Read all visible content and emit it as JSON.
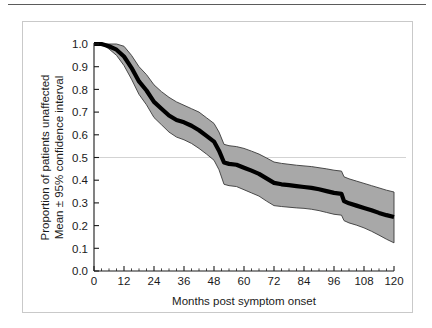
{
  "figure": {
    "top_rule": "horizontal-rule",
    "border_color": "#c9c9c9",
    "background": "#ffffff"
  },
  "chart_data": {
    "type": "line",
    "title": "",
    "subtitle": "",
    "xlabel": "Months post symptom onset",
    "ylabel": "Proportion of patients unaffected",
    "ylabel_line2": "Mean ± 95% confidence interval",
    "xlim": [
      0,
      120
    ],
    "ylim": [
      0.0,
      1.0
    ],
    "xticks": [
      0,
      12,
      24,
      36,
      48,
      60,
      72,
      84,
      96,
      108,
      120
    ],
    "xtick_labels": [
      "0",
      "12",
      "24",
      "36",
      "48",
      "60",
      "72",
      "84",
      "96",
      "108",
      "120"
    ],
    "yticks": [
      0.0,
      0.1,
      0.2,
      0.3,
      0.4,
      0.5,
      0.6,
      0.7,
      0.8,
      0.9,
      1.0
    ],
    "ytick_labels": [
      "0.0",
      "0.1",
      "0.2",
      "0.3",
      "0.4",
      "0.5",
      "0.6",
      "0.7",
      "0.8",
      "0.9",
      "1.0"
    ],
    "minor_xtick_interval": 3,
    "grid": false,
    "reference_line": {
      "axis": "y",
      "value": 0.5,
      "color": "#c8c8c8",
      "width": 0.8
    },
    "legend": null,
    "legend_position": "none",
    "colors": {
      "mean_line": "#000000",
      "confidence_band": "#a8a8a8",
      "band_edge": "#3a3a3a",
      "axis": "#1a1a1a",
      "text": "#1a1a1a"
    },
    "mean_line_width": 4.2,
    "x": [
      0,
      3,
      6,
      9,
      12,
      15,
      18,
      21,
      24,
      27,
      30,
      33,
      36,
      39,
      42,
      45,
      48,
      50,
      52,
      54,
      57,
      60,
      63,
      66,
      69,
      72,
      75,
      78,
      81,
      84,
      87,
      90,
      93,
      96,
      99,
      100,
      102,
      105,
      108,
      111,
      114,
      117,
      120
    ],
    "series": [
      {
        "name": "Mean proportion unaffected",
        "values": [
          1.0,
          1.0,
          0.99,
          0.975,
          0.945,
          0.895,
          0.835,
          0.795,
          0.745,
          0.715,
          0.685,
          0.665,
          0.655,
          0.64,
          0.62,
          0.595,
          0.57,
          0.53,
          0.478,
          0.472,
          0.468,
          0.455,
          0.442,
          0.428,
          0.408,
          0.388,
          0.382,
          0.378,
          0.374,
          0.37,
          0.366,
          0.36,
          0.352,
          0.344,
          0.34,
          0.308,
          0.298,
          0.288,
          0.278,
          0.268,
          0.256,
          0.246,
          0.238
        ]
      },
      {
        "name": "Upper 95% confidence limit",
        "values": [
          1.0,
          1.0,
          1.0,
          1.0,
          0.99,
          0.95,
          0.9,
          0.865,
          0.82,
          0.79,
          0.765,
          0.745,
          0.73,
          0.715,
          0.7,
          0.675,
          0.65,
          0.612,
          0.558,
          0.552,
          0.548,
          0.54,
          0.528,
          0.515,
          0.498,
          0.48,
          0.474,
          0.47,
          0.466,
          0.463,
          0.46,
          0.455,
          0.45,
          0.444,
          0.44,
          0.415,
          0.406,
          0.396,
          0.386,
          0.376,
          0.366,
          0.356,
          0.348
        ]
      },
      {
        "name": "Lower 95% confidence limit",
        "values": [
          1.0,
          1.0,
          0.978,
          0.95,
          0.905,
          0.845,
          0.778,
          0.732,
          0.676,
          0.644,
          0.612,
          0.59,
          0.578,
          0.562,
          0.54,
          0.515,
          0.488,
          0.446,
          0.382,
          0.376,
          0.372,
          0.358,
          0.344,
          0.33,
          0.308,
          0.288,
          0.284,
          0.281,
          0.278,
          0.276,
          0.272,
          0.266,
          0.258,
          0.25,
          0.246,
          0.222,
          0.212,
          0.202,
          0.19,
          0.175,
          0.158,
          0.14,
          0.124
        ]
      }
    ]
  }
}
